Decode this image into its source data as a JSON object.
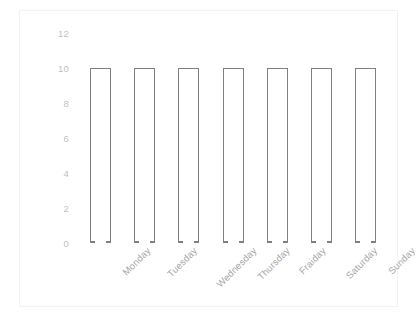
{
  "chart_data": {
    "type": "bar",
    "title": "",
    "subtitle": "",
    "xlabel": "",
    "ylabel": "",
    "categories": [
      "Monday",
      "Tuesday",
      "Wednesday",
      "Thursday",
      "Fraiday",
      "Saturday",
      "Sunday"
    ],
    "values": [
      10,
      10,
      10,
      10,
      10,
      10,
      10
    ],
    "series": [
      {
        "name": "",
        "values": [
          10,
          10,
          10,
          10,
          10,
          10,
          10
        ]
      }
    ],
    "ylim": [
      0,
      12
    ],
    "y_ticks": [
      0,
      2,
      4,
      6,
      8,
      10,
      12
    ],
    "y_tick_labels": [
      "0",
      "2",
      "4",
      "6",
      "8",
      "10",
      "12"
    ],
    "grid": false,
    "legend": false,
    "legend_position": "none",
    "bar_fill_color": "#ffffff",
    "bar_border_color": "#808080",
    "axis_label_color": "#bfbfbf",
    "category_label_color": "#a6a6a6",
    "frame_border_color": "#f2f2f2",
    "background_color": "#ffffff",
    "x_label_rotation_degrees": -45,
    "annotations": []
  }
}
